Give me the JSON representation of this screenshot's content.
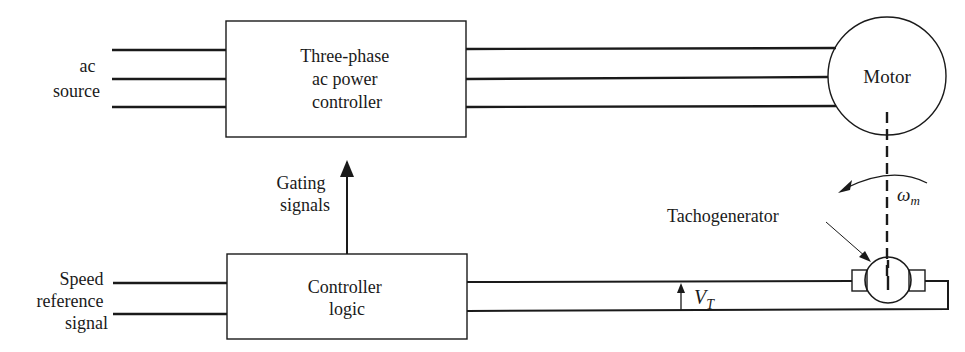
{
  "diagram": {
    "blocks": {
      "power_controller": {
        "lines": [
          "Three-phase",
          "ac power",
          "controller"
        ]
      },
      "controller_logic": {
        "lines": [
          "Controller",
          "logic"
        ]
      },
      "motor": {
        "label": "Motor"
      },
      "tachogenerator": {
        "label": "Tachogenerator"
      }
    },
    "labels": {
      "ac_source": [
        "ac",
        "source"
      ],
      "speed_reference": [
        "Speed",
        "reference",
        "signal"
      ],
      "gating_signals": [
        "Gating",
        "signals"
      ],
      "tacho_voltage": {
        "symbol": "V",
        "subscript": "T"
      },
      "motor_speed": {
        "symbol": "ω",
        "subscript": "m"
      }
    },
    "connections": [
      {
        "from": "ac source",
        "to": "power_controller",
        "wires": 3
      },
      {
        "from": "power_controller",
        "to": "motor",
        "wires": 3
      },
      {
        "from": "controller_logic",
        "to": "power_controller",
        "label": "Gating signals"
      },
      {
        "from": "speed reference signal",
        "to": "controller_logic",
        "wires": 2
      },
      {
        "from": "tachogenerator",
        "to": "controller_logic",
        "wires": 2,
        "label": "V_T"
      },
      {
        "from": "motor",
        "to": "tachogenerator",
        "type": "mechanical shaft"
      }
    ]
  }
}
